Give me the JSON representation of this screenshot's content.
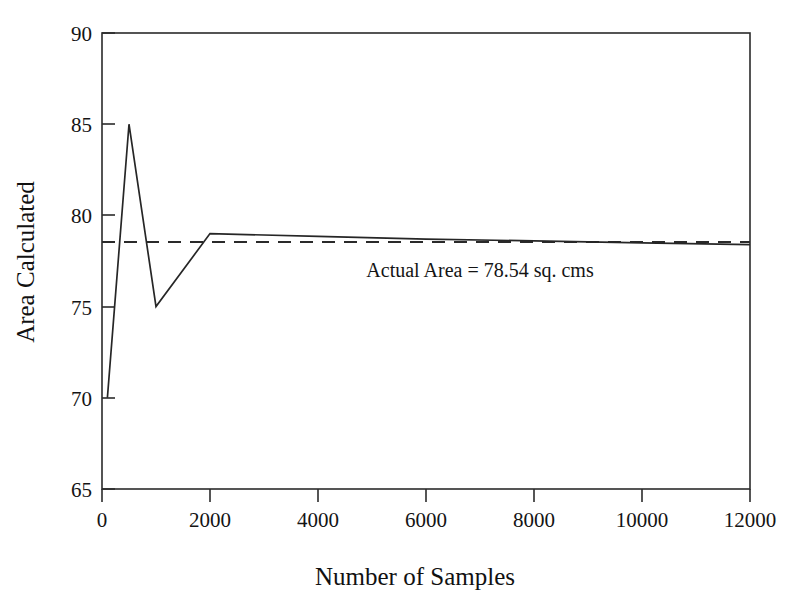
{
  "chart_data": {
    "type": "line",
    "title": "",
    "xlabel": "Number of Samples",
    "ylabel": "Area Calculated",
    "xlim": [
      0,
      12000
    ],
    "ylim": [
      65,
      90
    ],
    "xticks": [
      0,
      2000,
      4000,
      6000,
      8000,
      10000,
      12000
    ],
    "xtick_labels": [
      "0",
      "2000",
      "4000",
      "6000",
      "8000",
      "10000",
      "12000"
    ],
    "yticks": [
      65,
      70,
      75,
      80,
      85,
      90
    ],
    "ytick_labels": [
      "65",
      "70",
      "75",
      "80",
      "85",
      "90"
    ],
    "grid": false,
    "legend": "none",
    "series": [
      {
        "name": "Area Calculated",
        "style": "solid",
        "color": "#262626",
        "x": [
          100,
          500,
          1000,
          2000,
          4000,
          6000,
          8000,
          10000,
          12000
        ],
        "values": [
          70.0,
          85.0,
          75.0,
          79.0,
          78.85,
          78.7,
          78.6,
          78.5,
          78.4
        ]
      },
      {
        "name": "Actual Area",
        "style": "dashed",
        "color": "#2a2a2a",
        "x": [
          0,
          12000
        ],
        "values": [
          78.54,
          78.54
        ]
      }
    ],
    "annotations": [
      {
        "text": "Actual Area = 78.54 sq. cms",
        "x": 7000,
        "y": 76.6
      }
    ],
    "reference_value": 78.54,
    "reference_label": "Actual Area = 78.54 sq. cms"
  },
  "axes": {
    "x_title": "Number of Samples",
    "y_title": "Area Calculated",
    "x_tick_labels": [
      "0",
      "2000",
      "4000",
      "6000",
      "8000",
      "10000",
      "12000"
    ],
    "y_tick_labels": [
      "90",
      "85",
      "80",
      "75",
      "70",
      "65"
    ]
  },
  "annotation": {
    "label": "Actual Area = 78.54 sq. cms"
  }
}
